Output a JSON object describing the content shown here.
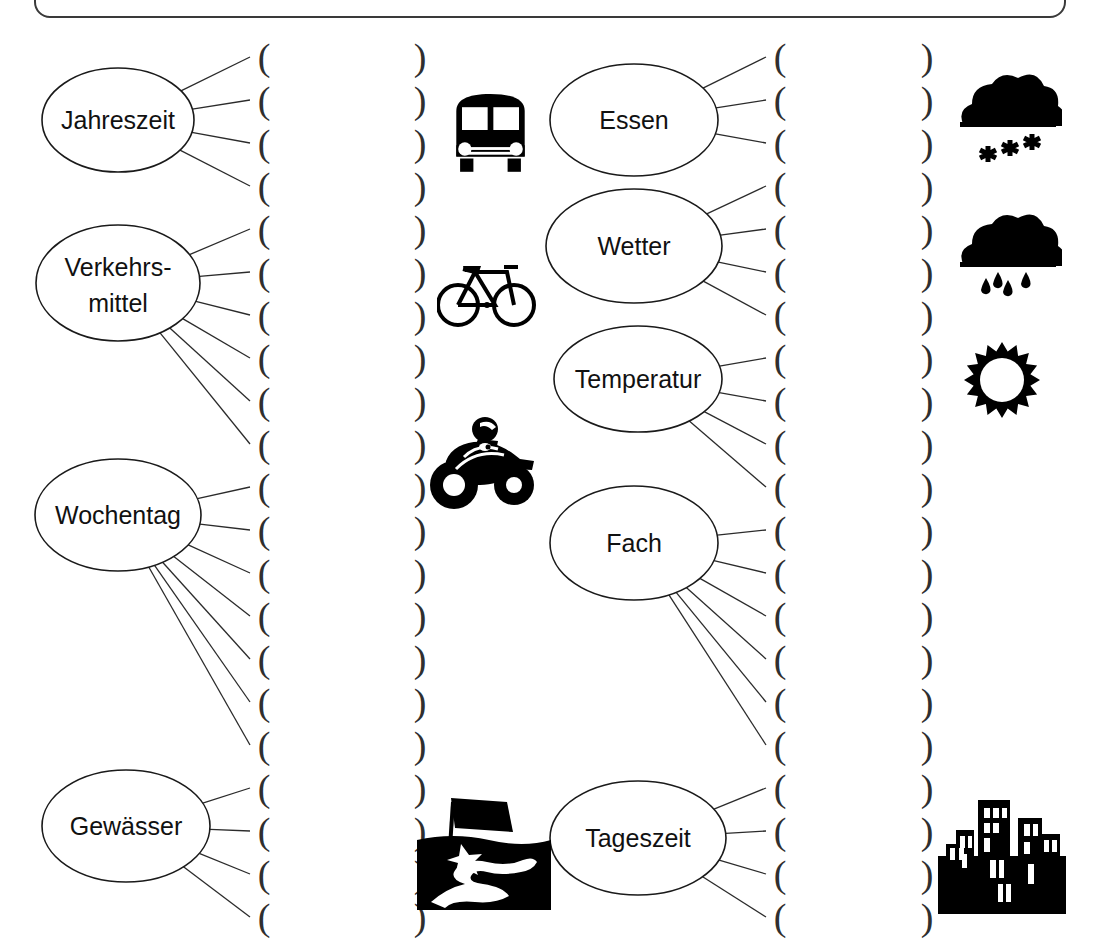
{
  "worksheet": {
    "title": "Wortfelder Mindmap Arbeitsblatt",
    "language": "de",
    "ink_color": "#1a1a1a",
    "paper_color": "#ffffff",
    "open_paren": "(",
    "close_paren": ")"
  },
  "topbox": {
    "label": ""
  },
  "nodes": [
    {
      "id": "jahreszeit",
      "label": "Jahreszeit",
      "line_count": 4,
      "column": "left",
      "cx": 118,
      "cy": 120,
      "rx": 76,
      "ry": 52
    },
    {
      "id": "verkehrsmittel",
      "label": "Verkehrs-",
      "label2": "mittel",
      "line_count": 6,
      "column": "left",
      "cx": 118,
      "cy": 283,
      "rx": 82,
      "ry": 58
    },
    {
      "id": "wochentag",
      "label": "Wochentag",
      "line_count": 7,
      "column": "left",
      "cx": 118,
      "cy": 515,
      "rx": 83,
      "ry": 56
    },
    {
      "id": "gewaesser",
      "label": "Gewässer",
      "line_count": 5,
      "column": "left",
      "cx": 126,
      "cy": 826,
      "rx": 84,
      "ry": 56
    },
    {
      "id": "essen",
      "label": "Essen",
      "line_count": 3,
      "column": "right",
      "cx": 634,
      "cy": 120,
      "rx": 84,
      "ry": 56
    },
    {
      "id": "wetter",
      "label": "Wetter",
      "line_count": 4,
      "column": "right",
      "cx": 634,
      "cy": 246,
      "rx": 88,
      "ry": 57
    },
    {
      "id": "temperatur",
      "label": "Temperatur",
      "line_count": 4,
      "column": "right",
      "cx": 638,
      "cy": 379,
      "rx": 84,
      "ry": 53
    },
    {
      "id": "fach",
      "label": "Fach",
      "line_count": 6,
      "column": "right",
      "cx": 634,
      "cy": 543,
      "rx": 84,
      "ry": 57
    },
    {
      "id": "tageszeit",
      "label": "Tageszeit",
      "line_count": 5,
      "column": "right",
      "cx": 638,
      "cy": 838,
      "rx": 88,
      "ry": 57
    }
  ],
  "blank_columns": {
    "left_open": {
      "x": 254,
      "count": 21,
      "first_y": 38,
      "step": 43.0,
      "char": "("
    },
    "left_close": {
      "x": 410,
      "count": 21,
      "first_y": 38,
      "step": 43.0,
      "char": ")"
    },
    "right_open": {
      "x": 770,
      "count": 21,
      "first_y": 38,
      "step": 43.0,
      "char": "("
    },
    "right_close": {
      "x": 917,
      "count": 21,
      "first_y": 38,
      "step": 43.0,
      "char": ")"
    }
  },
  "pictograms": [
    {
      "id": "bus",
      "name": "bus-icon",
      "x": 443,
      "y": 82,
      "w": 95,
      "h": 96,
      "alt": "Bus"
    },
    {
      "id": "bicycle",
      "name": "bicycle-icon",
      "x": 437,
      "y": 250,
      "w": 100,
      "h": 82,
      "alt": "Fahrrad"
    },
    {
      "id": "motorcycle",
      "name": "motorcycle-icon",
      "x": 428,
      "y": 417,
      "w": 112,
      "h": 98,
      "alt": "Motorrad"
    },
    {
      "id": "map",
      "name": "map-river-icon",
      "x": 409,
      "y": 790,
      "w": 150,
      "h": 130,
      "alt": "Landkarte mit Fluss"
    },
    {
      "id": "snow",
      "name": "snow-cloud-icon",
      "x": 952,
      "y": 68,
      "w": 110,
      "h": 95,
      "alt": "Schneewolke"
    },
    {
      "id": "rain",
      "name": "rain-cloud-icon",
      "x": 952,
      "y": 208,
      "w": 110,
      "h": 95,
      "alt": "Regenwolke"
    },
    {
      "id": "sun",
      "name": "sun-icon",
      "x": 962,
      "y": 340,
      "w": 80,
      "h": 80,
      "alt": "Sonne"
    },
    {
      "id": "city",
      "name": "city-skyline-icon",
      "x": 932,
      "y": 790,
      "w": 140,
      "h": 130,
      "alt": "Stadt"
    }
  ]
}
